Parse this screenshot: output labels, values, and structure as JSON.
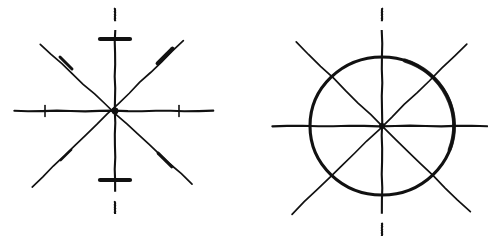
{
  "document": {
    "background_color": "#ffffff",
    "ink_color": "#111111",
    "width": 488,
    "height": 241,
    "caption": ""
  },
  "figures": [
    {
      "id": "left-figure",
      "name": "eight-fold-star-axes-diagram",
      "label": "",
      "center": {
        "x": 115,
        "y": 111
      },
      "has_circle": false,
      "axes": [
        {
          "name": "vertical-axis",
          "orientation": "vertical",
          "angle_deg": 90,
          "style": "dashed-ends",
          "x1": 115,
          "y1": 8,
          "x2": 115,
          "y2": 214,
          "stroke_width": 2.1
        },
        {
          "name": "horizontal-axis",
          "orientation": "horizontal",
          "angle_deg": 0,
          "style": "solid",
          "x1": 14,
          "y1": 111,
          "x2": 213,
          "y2": 111,
          "stroke_width": 2.1
        },
        {
          "name": "diagonal-axis-nw-se",
          "orientation": "diagonal",
          "angle_deg": 135,
          "style": "solid",
          "x1": 40,
          "y1": 44,
          "x2": 192,
          "y2": 184,
          "stroke_width": 1.7
        },
        {
          "name": "diagonal-axis-sw-ne",
          "orientation": "diagonal",
          "angle_deg": 45,
          "style": "solid",
          "x1": 32,
          "y1": 187,
          "x2": 183,
          "y2": 41,
          "stroke_width": 1.7
        }
      ],
      "tick_marks": [
        {
          "name": "tick-vertical-top",
          "x": 115,
          "y": 39,
          "angle_deg": 0,
          "length": 30,
          "weight": 4.2
        },
        {
          "name": "tick-vertical-bottom",
          "x": 115,
          "y": 180,
          "angle_deg": 0,
          "length": 30,
          "weight": 4.2
        },
        {
          "name": "tick-horizontal-left",
          "x": 45,
          "y": 111,
          "angle_deg": 90,
          "length": 11,
          "weight": 1.6
        },
        {
          "name": "tick-horizontal-right",
          "x": 179,
          "y": 111,
          "angle_deg": 90,
          "length": 11,
          "weight": 1.6
        },
        {
          "name": "tick-diagonal-upper-left",
          "x": 66,
          "y": 63,
          "angle_deg": 45,
          "length": 17,
          "weight": 2.9
        },
        {
          "name": "tick-diagonal-upper-right",
          "x": 165,
          "y": 56,
          "angle_deg": 135,
          "length": 21,
          "weight": 4.0
        },
        {
          "name": "tick-diagonal-lower-left",
          "x": 66,
          "y": 155,
          "angle_deg": 135,
          "length": 15,
          "weight": 2.2
        },
        {
          "name": "tick-diagonal-lower-right",
          "x": 165,
          "y": 160,
          "angle_deg": 45,
          "length": 19,
          "weight": 3.2
        }
      ],
      "center_marker": {
        "name": "center-node",
        "radius": 3.4
      }
    },
    {
      "id": "right-figure",
      "name": "circle-with-eight-fold-axes-diagram",
      "label": "",
      "center": {
        "x": 382,
        "y": 126
      },
      "has_circle": true,
      "circle": {
        "name": "outer-circle",
        "cx": 382,
        "cy": 126,
        "rx": 72,
        "ry": 69,
        "stroke_width": 3.1
      },
      "axes": [
        {
          "name": "vertical-axis",
          "orientation": "vertical",
          "angle_deg": 90,
          "style": "dashed-ends",
          "x1": 382,
          "y1": 8,
          "x2": 382,
          "y2": 236,
          "stroke_width": 2.1
        },
        {
          "name": "horizontal-axis",
          "orientation": "horizontal",
          "angle_deg": 0,
          "style": "solid",
          "x1": 272,
          "y1": 126,
          "x2": 487,
          "y2": 126,
          "stroke_width": 2.1
        },
        {
          "name": "diagonal-axis-nw-se",
          "orientation": "diagonal",
          "angle_deg": 135,
          "style": "solid",
          "x1": 296,
          "y1": 42,
          "x2": 470,
          "y2": 212,
          "stroke_width": 1.7
        },
        {
          "name": "diagonal-axis-sw-ne",
          "orientation": "diagonal",
          "angle_deg": 45,
          "style": "solid",
          "x1": 292,
          "y1": 214,
          "x2": 467,
          "y2": 44,
          "stroke_width": 1.7
        }
      ],
      "tick_marks": [],
      "center_marker": {
        "name": "center-node",
        "radius": 3.0
      }
    }
  ]
}
